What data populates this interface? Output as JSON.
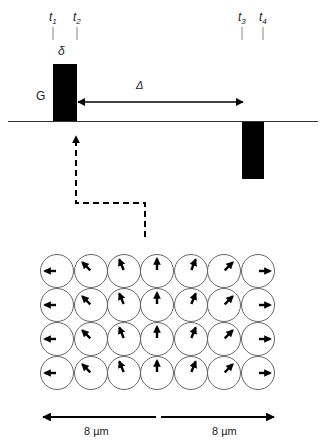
{
  "diagram": {
    "pulse_sequence": {
      "time_marks": [
        {
          "base": "t",
          "sub": "1",
          "x": 53
        },
        {
          "base": "t",
          "sub": "2",
          "x": 77
        },
        {
          "base": "t",
          "sub": "3",
          "x": 242
        },
        {
          "base": "t",
          "sub": "4",
          "x": 263
        }
      ],
      "gradient_label": "G",
      "pulse_width_label": "δ",
      "diffusion_time_label": "Δ",
      "pulses": [
        {
          "name": "first-gradient-pulse",
          "x": 53,
          "y": 64,
          "w": 24,
          "h": 57
        },
        {
          "name": "second-gradient-pulse",
          "x": 242,
          "y": 122,
          "w": 22,
          "h": 57
        }
      ],
      "colors": {
        "pulse": "#000000",
        "baseline": "#333333",
        "tick": "#888888"
      }
    },
    "spin_grid": {
      "rows": 4,
      "columns": 7,
      "column_centers": [
        57,
        91,
        124,
        157,
        191,
        224,
        258
      ],
      "row_centers": [
        271,
        305,
        339,
        373
      ],
      "radius": 16.5,
      "arrow_angles_deg": [
        180,
        135,
        112,
        90,
        68,
        45,
        0
      ]
    },
    "scale": {
      "left_label": "8 µm",
      "right_label": "8 µm"
    }
  }
}
